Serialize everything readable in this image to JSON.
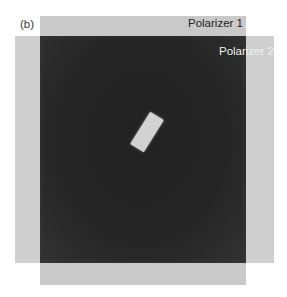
{
  "figure": {
    "panel_label": "(b)",
    "polarizer_1_label": "Polarizer 1",
    "polarizer_2_label": "Polarizer 2",
    "colors": {
      "background": "#ffffff",
      "polarizer": "#c9c9c9",
      "crossed_overlap": "#262626",
      "sample": "#d2d2d2"
    }
  }
}
